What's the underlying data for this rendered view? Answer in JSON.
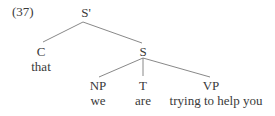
{
  "example_number": "(37)",
  "tree": {
    "root": {
      "label": "S'",
      "x": 86,
      "y": 6
    },
    "nodes": [
      {
        "id": "C",
        "label": "C",
        "word": "that",
        "x": 41,
        "y": 46,
        "wy": 61
      },
      {
        "id": "S",
        "label": "S",
        "x": 143,
        "y": 45
      },
      {
        "id": "NP",
        "label": "NP",
        "word": "we",
        "x": 98,
        "y": 79,
        "wy": 95
      },
      {
        "id": "T",
        "label": "T",
        "word": "are",
        "x": 143,
        "y": 79,
        "wy": 95
      },
      {
        "id": "VP",
        "label": "VP",
        "word": "trying to help you",
        "x": 211,
        "y": 79,
        "wy": 95
      }
    ],
    "edges": [
      [
        "S'",
        "C"
      ],
      [
        "S'",
        "S"
      ],
      [
        "S",
        "NP"
      ],
      [
        "S",
        "T"
      ],
      [
        "S",
        "VP"
      ]
    ]
  }
}
